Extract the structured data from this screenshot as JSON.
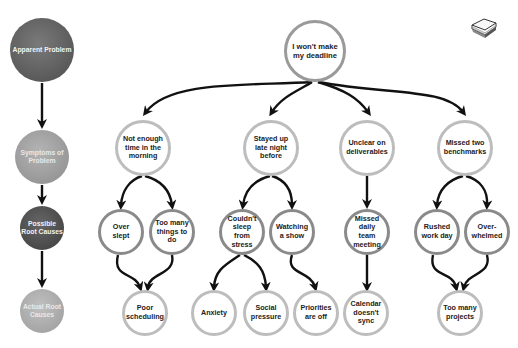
{
  "legend": [
    {
      "label": "Apparent Problem",
      "color": "#626262"
    },
    {
      "label": "Symptoms of Problem",
      "color": "#a3a3a3"
    },
    {
      "label": "Possible Root Causes",
      "color": "#525252"
    },
    {
      "label": "Actual Root Causes",
      "color": "#b0b0b0"
    }
  ],
  "apparent_problem": {
    "label": "I won't make my deadline"
  },
  "symptoms": [
    {
      "label": "Not enough time in the morning"
    },
    {
      "label": "Stayed up late night before"
    },
    {
      "label": "Unclear on deliverables"
    },
    {
      "label": "Missed two benchmarks"
    }
  ],
  "possible_causes": [
    {
      "label": "Over slept"
    },
    {
      "label": "Too many things to do"
    },
    {
      "label": "Couldn't sleep from stress"
    },
    {
      "label": "Watching a show"
    },
    {
      "label": "Missed daily team meeting"
    },
    {
      "label": "Rushed work day"
    },
    {
      "label": "Over-whelmed"
    }
  ],
  "actual_causes": [
    {
      "label": "Poor scheduling"
    },
    {
      "label": "Anxiety"
    },
    {
      "label": "Social pressure"
    },
    {
      "label": "Priorities are off"
    },
    {
      "label": "Calendar doesn't sync"
    },
    {
      "label": "Too many projects"
    }
  ],
  "icons": {
    "corner": "stack-of-notes-icon"
  }
}
